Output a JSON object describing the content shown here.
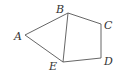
{
  "diagram": {
    "type": "geometric-figure",
    "vertices": [
      {
        "id": "A",
        "label": "A",
        "x": 25,
        "y": 35,
        "label_x": 14,
        "label_y": 40
      },
      {
        "id": "B",
        "label": "B",
        "x": 68,
        "y": 13,
        "label_x": 56,
        "label_y": 13
      },
      {
        "id": "C",
        "label": "C",
        "x": 101,
        "y": 24,
        "label_x": 104,
        "label_y": 29
      },
      {
        "id": "D",
        "label": "D",
        "x": 101,
        "y": 58,
        "label_x": 104,
        "label_y": 65
      },
      {
        "id": "E",
        "label": "E",
        "x": 63,
        "y": 62,
        "label_x": 49,
        "label_y": 70
      }
    ],
    "edges": [
      [
        "A",
        "B"
      ],
      [
        "B",
        "C"
      ],
      [
        "C",
        "D"
      ],
      [
        "D",
        "E"
      ],
      [
        "E",
        "A"
      ],
      [
        "B",
        "E"
      ]
    ],
    "colors": {
      "line": "#555555",
      "label": "#333333",
      "background": "#ffffff"
    }
  }
}
